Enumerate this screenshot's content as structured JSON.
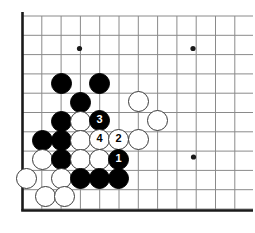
{
  "board": {
    "title": "Go board corner diagram",
    "background_color": "#ffffff",
    "line_color": "#8a8a8a",
    "edge_color": "#1a1a1a",
    "black_color": "#000000",
    "white_color": "#ffffff",
    "white_outline_color": "#3a3a3a",
    "geometry": {
      "origin_x": 22.5,
      "origin_y": 16,
      "step_x": 19.3,
      "step_y": 19.3,
      "cols": 12,
      "rows": 10,
      "edge_left_x": 22.5,
      "edge_top_y": 16,
      "edge_bottom_y": 210.5,
      "grid_right_x": 253,
      "grid_bottom_y": 210.5
    },
    "star_points": [
      {
        "name": "star-point-1",
        "x": 79.5,
        "y": 48.5
      },
      {
        "name": "star-point-2",
        "x": 193,
        "y": 48.5
      },
      {
        "name": "star-point-3",
        "x": 193.5,
        "y": 157
      }
    ],
    "stones": [
      {
        "id": "black-a",
        "color": "black",
        "x": 61,
        "y": 83,
        "label": ""
      },
      {
        "id": "black-b",
        "color": "black",
        "x": 99,
        "y": 83,
        "label": ""
      },
      {
        "id": "black-c",
        "color": "black",
        "x": 80,
        "y": 102,
        "label": ""
      },
      {
        "id": "black-d",
        "color": "black",
        "x": 61,
        "y": 121,
        "label": ""
      },
      {
        "id": "white-a",
        "color": "white",
        "x": 80,
        "y": 121,
        "label": ""
      },
      {
        "id": "move-3",
        "color": "black",
        "x": 99.5,
        "y": 120,
        "label": "3"
      },
      {
        "id": "white-b",
        "color": "white",
        "x": 138,
        "y": 101,
        "label": ""
      },
      {
        "id": "white-c",
        "color": "white",
        "x": 157,
        "y": 120,
        "label": ""
      },
      {
        "id": "black-e",
        "color": "black",
        "x": 42,
        "y": 140,
        "label": ""
      },
      {
        "id": "black-f",
        "color": "black",
        "x": 61,
        "y": 140,
        "label": ""
      },
      {
        "id": "white-d",
        "color": "white",
        "x": 80,
        "y": 140,
        "label": ""
      },
      {
        "id": "move-4",
        "color": "white",
        "x": 99.5,
        "y": 139,
        "label": "4"
      },
      {
        "id": "move-2",
        "color": "white",
        "x": 118.5,
        "y": 139,
        "label": "2"
      },
      {
        "id": "white-e",
        "color": "white",
        "x": 138,
        "y": 139,
        "label": ""
      },
      {
        "id": "white-f",
        "color": "white",
        "x": 42,
        "y": 159,
        "label": ""
      },
      {
        "id": "black-g",
        "color": "black",
        "x": 61,
        "y": 159,
        "label": ""
      },
      {
        "id": "white-g",
        "color": "white",
        "x": 80,
        "y": 159,
        "label": ""
      },
      {
        "id": "white-h",
        "color": "white",
        "x": 99.5,
        "y": 159,
        "label": ""
      },
      {
        "id": "move-1",
        "color": "black",
        "x": 118.5,
        "y": 159,
        "label": "1"
      },
      {
        "id": "white-i",
        "color": "white",
        "x": 26,
        "y": 178,
        "label": ""
      },
      {
        "id": "white-j",
        "color": "white",
        "x": 61,
        "y": 178,
        "label": ""
      },
      {
        "id": "black-h",
        "color": "black",
        "x": 80,
        "y": 178,
        "label": ""
      },
      {
        "id": "black-i",
        "color": "black",
        "x": 99.5,
        "y": 178,
        "label": ""
      },
      {
        "id": "black-j",
        "color": "black",
        "x": 118.5,
        "y": 178,
        "label": ""
      },
      {
        "id": "white-k",
        "color": "white",
        "x": 45,
        "y": 196,
        "label": ""
      },
      {
        "id": "white-l",
        "color": "white",
        "x": 64,
        "y": 196,
        "label": ""
      }
    ],
    "stone_radius": 10.5
  }
}
